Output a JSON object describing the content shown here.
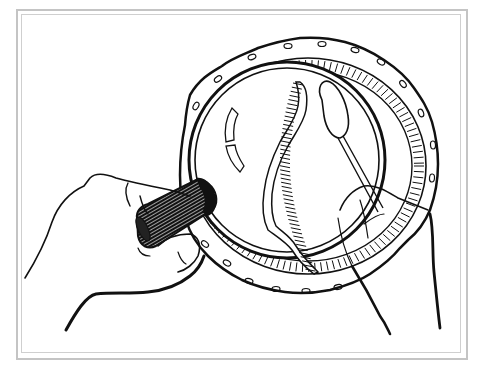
{
  "illustration": {
    "caption": "Hands holding a magnifying glass over a segmented worm in a petri dish, with a cotton swab",
    "style": "black-and-white line drawing",
    "colors": {
      "ink": "#111111",
      "paper": "#ffffff",
      "frame": "#c4c4c4"
    },
    "elements": {
      "petri_dish": "petri-dish",
      "magnifying_glass": "magnifying-glass",
      "worm": "earthworm",
      "cotton_swab": "cotton-swab",
      "left_hand": "left-hand",
      "right_hand": "right-hand"
    }
  }
}
